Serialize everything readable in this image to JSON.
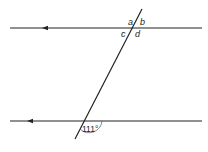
{
  "diagram": {
    "type": "parallel-lines-transversal",
    "labels": {
      "a": "a",
      "b": "b",
      "c": "c",
      "d": "d",
      "angle": "111°"
    },
    "colors": {
      "line": "#222222",
      "background": "#ffffff"
    }
  }
}
